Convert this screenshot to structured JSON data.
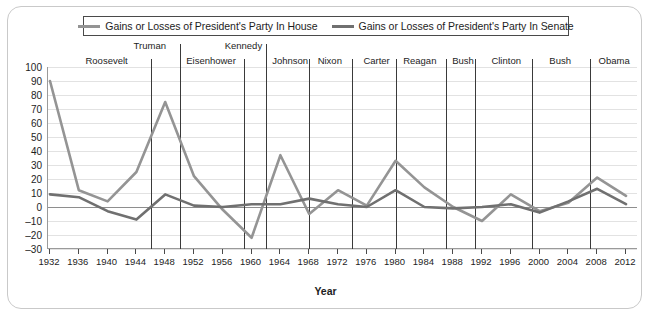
{
  "legend": {
    "entries": [
      {
        "label": "Gains or Losses of President's Party In House",
        "color": "#949494",
        "icon": "line-swatch"
      },
      {
        "label": "Gains or Losses of President's Party In Senate",
        "color": "#707070",
        "icon": "line-swatch"
      }
    ]
  },
  "axes": {
    "x_title": "Year",
    "y_ticks": [
      100,
      90,
      80,
      70,
      60,
      50,
      40,
      30,
      20,
      10,
      0,
      -10,
      -20,
      -30
    ],
    "y_tick_labels": [
      "100",
      "90",
      "80",
      "70",
      "60",
      "50",
      "40",
      "30",
      "20",
      "10",
      "0",
      "–10",
      "–20",
      "–30"
    ],
    "x_ticks": [
      1932,
      1936,
      1940,
      1944,
      1948,
      1952,
      1956,
      1960,
      1964,
      1968,
      1972,
      1976,
      1980,
      1984,
      1988,
      1992,
      1996,
      2000,
      2004,
      2008,
      2012
    ]
  },
  "presidents": [
    {
      "name": "Roosevelt",
      "center_year": 1940,
      "raised": false,
      "divider_after": 1946
    },
    {
      "name": "Truman",
      "center_year": 1946,
      "raised": true,
      "divider_after": 1950
    },
    {
      "name": "Eisenhower",
      "center_year": 1954.5,
      "raised": false,
      "divider_after": 1959
    },
    {
      "name": "Kennedy",
      "center_year": 1959,
      "raised": true,
      "divider_after": 1962
    },
    {
      "name": "Johnson",
      "center_year": 1965.5,
      "raised": false,
      "divider_after": 1968
    },
    {
      "name": "Nixon",
      "center_year": 1971,
      "raised": false,
      "divider_after": 1974
    },
    {
      "name": "Carter",
      "center_year": 1977.5,
      "raised": false,
      "divider_after": 1980
    },
    {
      "name": "Reagan",
      "center_year": 1983.5,
      "raised": false,
      "divider_after": 1987
    },
    {
      "name": "Bush",
      "center_year": 1989.5,
      "raised": false,
      "divider_after": 1991
    },
    {
      "name": "Clinton",
      "center_year": 1995.5,
      "raised": false,
      "divider_after": 1999
    },
    {
      "name": "Bush",
      "center_year": 2003,
      "raised": false,
      "divider_after": 2007
    },
    {
      "name": "Obama",
      "center_year": 2010.5,
      "raised": false,
      "divider_after": null
    }
  ],
  "chart_data": {
    "type": "line",
    "title": "",
    "xlabel": "Year",
    "ylabel": "",
    "xlim": [
      1932,
      2012
    ],
    "ylim": [
      -30,
      100
    ],
    "grid": true,
    "legend_position": "top",
    "x": [
      1932,
      1936,
      1940,
      1944,
      1948,
      1952,
      1956,
      1960,
      1964,
      1968,
      1972,
      1976,
      1980,
      1984,
      1988,
      1992,
      1996,
      2000,
      2004,
      2008,
      2012
    ],
    "series": [
      {
        "name": "Gains or Losses of President's Party In House",
        "color": "#949494",
        "values": [
          90,
          12,
          4,
          25,
          75,
          22,
          -2,
          -22,
          37,
          -5,
          12,
          1,
          33,
          14,
          0,
          -10,
          9,
          -3,
          3,
          21,
          8
        ]
      },
      {
        "name": "Gains or Losses of President's Party In Senate",
        "color": "#707070",
        "values": [
          9,
          7,
          -3,
          -9,
          9,
          1,
          0,
          2,
          2,
          6,
          2,
          0,
          12,
          0,
          -1,
          0,
          2,
          -4,
          4,
          13,
          2
        ]
      }
    ]
  }
}
